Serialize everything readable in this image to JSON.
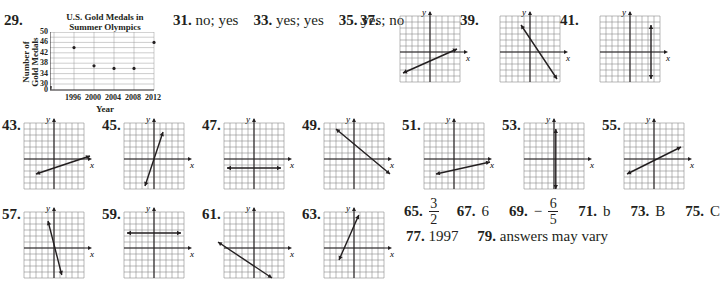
{
  "chart_data": {
    "type": "scatter",
    "title": "U.S. Gold Medals in Summer Olympics",
    "title_lines": [
      "U.S. Gold Medals in",
      "Summer Olympics"
    ],
    "xlabel": "Year",
    "ylabel": "Number of Gold Medals",
    "ylabel_lines": [
      "Number of",
      "Gold Medals"
    ],
    "x": [
      1996,
      2000,
      2004,
      2008,
      2012
    ],
    "values": [
      44,
      37,
      36,
      36,
      46
    ],
    "yticks": [
      0,
      30,
      34,
      38,
      42,
      46,
      50
    ],
    "xticks": [
      1996,
      2000,
      2004,
      2008,
      2012
    ],
    "ylim": [
      30,
      50
    ],
    "axis_break": true,
    "grid": true
  },
  "problem_29": {
    "number": "29."
  },
  "text_answers": [
    {
      "number": "31.",
      "answer": "no; yes"
    },
    {
      "number": "33.",
      "answer": "yes; yes"
    },
    {
      "number": "35.",
      "answer": "yes; no"
    }
  ],
  "graphs": [
    {
      "number": "37.",
      "x_label": "x",
      "y_label": "y",
      "line": [
        [
          -4.5,
          -3.5
        ],
        [
          4.5,
          0.5
        ]
      ]
    },
    {
      "number": "39.",
      "x_label": "x",
      "y_label": "y",
      "line": [
        [
          -1.5,
          4.5
        ],
        [
          4.5,
          -4.5
        ]
      ]
    },
    {
      "number": "41.",
      "x_label": "x",
      "y_label": "y",
      "line": [
        [
          3.5,
          4.5
        ],
        [
          3.5,
          -4.5
        ]
      ]
    },
    {
      "number": "43.",
      "x_label": "x",
      "y_label": "y",
      "line": [
        [
          -3,
          -2.5
        ],
        [
          6,
          0.5
        ]
      ]
    },
    {
      "number": "45.",
      "x_label": "x",
      "y_label": "y",
      "line": [
        [
          -1.5,
          -4.5
        ],
        [
          1.5,
          4.5
        ]
      ]
    },
    {
      "number": "47.",
      "x_label": "x",
      "y_label": "y",
      "line": [
        [
          -4.5,
          -1.5
        ],
        [
          4.5,
          -1.5
        ]
      ]
    },
    {
      "number": "49.",
      "x_label": "x",
      "y_label": "y",
      "line": [
        [
          -3,
          5
        ],
        [
          6,
          -2.5
        ]
      ]
    },
    {
      "number": "51.",
      "x_label": "x",
      "y_label": "y",
      "line": [
        [
          -3,
          -2.5
        ],
        [
          6,
          -0.5
        ]
      ]
    },
    {
      "number": "53.",
      "x_label": "x",
      "y_label": "y",
      "line": [
        [
          0.3,
          5
        ],
        [
          0.3,
          -5
        ]
      ]
    },
    {
      "number": "55.",
      "x_label": "x",
      "y_label": "y",
      "line": [
        [
          -4.5,
          -2.5
        ],
        [
          4.5,
          2
        ]
      ]
    },
    {
      "number": "57.",
      "x_label": "x",
      "y_label": "y",
      "line": [
        [
          -1,
          4.5
        ],
        [
          1.3,
          -4.5
        ]
      ]
    },
    {
      "number": "59.",
      "x_label": "x",
      "y_label": "y",
      "line": [
        [
          -4.5,
          2.5
        ],
        [
          4.5,
          2.5
        ]
      ]
    },
    {
      "number": "61.",
      "x_label": "x",
      "y_label": "y",
      "line": [
        [
          -6,
          1
        ],
        [
          3,
          -5
        ]
      ]
    },
    {
      "number": "63.",
      "x_label": "x",
      "y_label": "y",
      "line": [
        [
          -2.5,
          -2
        ],
        [
          0.8,
          5.5
        ]
      ]
    }
  ],
  "final_answers": {
    "a65": {
      "number": "65.",
      "numerator": "3",
      "denominator": "2"
    },
    "a67": {
      "number": "67.",
      "answer": "6"
    },
    "a69": {
      "number": "69.",
      "sign": "−",
      "numerator": "6",
      "denominator": "5"
    },
    "a71": {
      "number": "71.",
      "answer": "b"
    },
    "a73": {
      "number": "73.",
      "answer": "B"
    },
    "a75": {
      "number": "75.",
      "answer": "C"
    },
    "a77": {
      "number": "77.",
      "answer": "1997"
    },
    "a79": {
      "number": "79.",
      "answer": "answers may vary"
    }
  }
}
